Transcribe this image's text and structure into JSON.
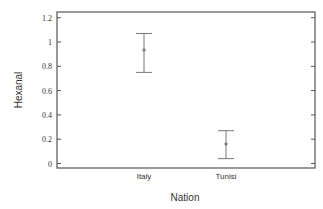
{
  "chart_data": {
    "type": "errorbar",
    "title": "",
    "xlabel": "Nation",
    "ylabel": "Hexanal",
    "categories": [
      "Italy",
      "Tunisi"
    ],
    "series": [
      {
        "name": "Hexanal",
        "values": [
          0.92,
          0.15
        ],
        "upper": [
          1.07,
          0.27
        ],
        "lower": [
          0.75,
          0.04
        ],
        "marker": "*"
      }
    ],
    "yticks": [
      "0",
      "0.2",
      "0.4",
      "0.6",
      "0.8",
      "1",
      "1.2"
    ],
    "ylim": [
      0,
      1.2
    ],
    "grid": false,
    "legend": null
  },
  "colors": {
    "axis": "#555555",
    "errorbar": "#777777",
    "marker": "#555555"
  }
}
